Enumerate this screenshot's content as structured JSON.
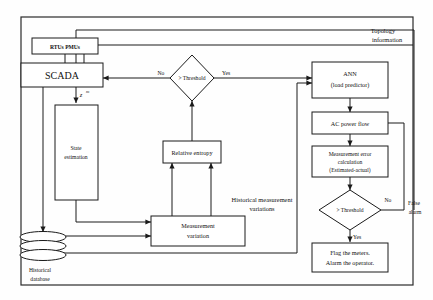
{
  "diagram": {
    "nodes": {
      "rtus": {
        "label": "RTUs PMUs"
      },
      "scada": {
        "label": "SCADA"
      },
      "state_estimation": {
        "line1": "State",
        "line2": "estimation"
      },
      "threshold_top": {
        "label": "> Threshold"
      },
      "ann": {
        "line1": "ANN",
        "line2": "(load predictor)"
      },
      "ac_power_flow": {
        "label": "AC power flow"
      },
      "meas_error": {
        "line1": "Measurement error",
        "line2": "calculation",
        "line3": "(Estimated-actual)"
      },
      "threshold_bottom": {
        "label": "> Threshold"
      },
      "flag": {
        "line1": "Flag the meters.",
        "line2": "Alarm the operator."
      },
      "relative_entropy": {
        "label": "Relative entropy"
      },
      "measurement_variation": {
        "line1": "Measurement",
        "line2": "variation"
      },
      "historical_database": {
        "line1": "Historical",
        "line2": "database"
      }
    },
    "edge_labels": {
      "z_measurement": "z",
      "z_superscript": "m",
      "top_no": "No",
      "top_yes": "Yes",
      "bottom_no": "No",
      "bottom_yes": "Yes",
      "false_alarm_1": "False",
      "false_alarm_2": "alarm",
      "topology_1": "Topology",
      "topology_2": "information",
      "hist_meas_1": "Historical measurement",
      "hist_meas_2": "variations"
    },
    "colors": {
      "stroke": "#1a1a1a",
      "fill": "#ffffff",
      "frame": "#2a2a2a",
      "background": "#fefefe"
    }
  }
}
